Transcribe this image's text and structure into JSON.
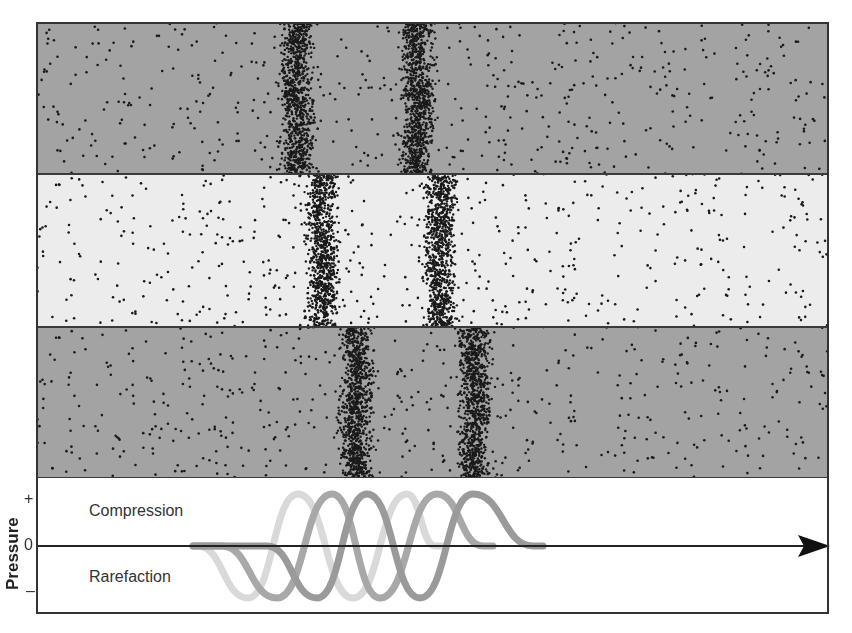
{
  "figure": {
    "type": "sound-wave-propagation-diagram",
    "frame": {
      "x": 37,
      "y": 23,
      "width": 791,
      "height": 590
    },
    "bands": [
      {
        "name": "band-top",
        "y": 23,
        "height": 151,
        "fill": "#a3a3a3",
        "compression_centers_x": [
          297,
          418
        ]
      },
      {
        "name": "band-middle",
        "y": 174,
        "height": 153,
        "fill": "#ececec",
        "compression_centers_x": [
          323,
          440
        ]
      },
      {
        "name": "band-bottom",
        "y": 327,
        "height": 151,
        "fill": "#a3a3a3",
        "compression_centers_x": [
          357,
          475
        ]
      }
    ],
    "dot_color": "#1a1a1a",
    "graph": {
      "y_axis_label": "Pressure",
      "ticks": {
        "plus": "+",
        "zero": "0",
        "minus": "–"
      },
      "region_labels": {
        "compression": "Compression",
        "rarefaction": "Rarefaction"
      },
      "zero_line_y": 546,
      "amplitude_px": 52,
      "arrow_end_x": 830,
      "waves": [
        {
          "name": "wave-light",
          "color": "#d9d9d9",
          "start_x": 195,
          "troughs_x": [
            248,
            353
          ],
          "peaks_x": [
            298,
            407
          ],
          "end_x": 445
        },
        {
          "name": "wave-medium",
          "color": "#a8a8a8",
          "start_x": 193,
          "troughs_x": [
            277,
            380
          ],
          "peaks_x": [
            332,
            437
          ],
          "end_x": 493
        },
        {
          "name": "wave-dark",
          "color": "#9a9a9a",
          "start_x": 193,
          "troughs_x": [
            317,
            420
          ],
          "peaks_x": [
            367,
            473
          ],
          "end_x": 543
        }
      ]
    }
  }
}
